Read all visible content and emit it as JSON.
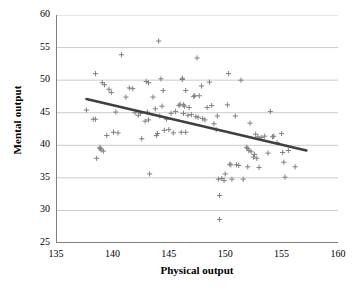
{
  "chart_data": {
    "type": "scatter",
    "title": "",
    "xlabel": "Physical output",
    "ylabel": "Mental output",
    "xlim": [
      135,
      160
    ],
    "ylim": [
      25,
      60
    ],
    "xticks": [
      135,
      140,
      145,
      150,
      155,
      160
    ],
    "yticks": [
      25,
      30,
      35,
      40,
      45,
      50,
      55,
      60
    ],
    "grid": "horizontal",
    "legend": "none",
    "marker": "plus",
    "marker_color": "#808080",
    "trendline_color": "#404040",
    "trendline": {
      "x": [
        137.7,
        157.2
      ],
      "y": [
        47.1,
        39.2
      ]
    },
    "points": [
      [
        137.7,
        45.4
      ],
      [
        138.3,
        44.0
      ],
      [
        138.5,
        44.0
      ],
      [
        138.5,
        51.0
      ],
      [
        138.6,
        38.0
      ],
      [
        138.9,
        39.7
      ],
      [
        138.9,
        39.5
      ],
      [
        139.0,
        39.3
      ],
      [
        139.1,
        49.6
      ],
      [
        139.2,
        39.1
      ],
      [
        139.3,
        49.3
      ],
      [
        139.5,
        41.5
      ],
      [
        139.7,
        48.6
      ],
      [
        139.9,
        48.1
      ],
      [
        140.1,
        42.0
      ],
      [
        140.3,
        45.1
      ],
      [
        140.5,
        41.9
      ],
      [
        140.8,
        53.9
      ],
      [
        141.2,
        47.4
      ],
      [
        141.5,
        48.8
      ],
      [
        141.8,
        48.7
      ],
      [
        142.0,
        45.0
      ],
      [
        142.3,
        44.6
      ],
      [
        142.5,
        44.9
      ],
      [
        142.6,
        41.0
      ],
      [
        142.9,
        43.7
      ],
      [
        143.0,
        49.8
      ],
      [
        143.1,
        45.1
      ],
      [
        143.2,
        49.6
      ],
      [
        143.2,
        43.9
      ],
      [
        143.3,
        35.6
      ],
      [
        143.6,
        47.4
      ],
      [
        143.8,
        45.6
      ],
      [
        143.9,
        41.5
      ],
      [
        144.0,
        41.8
      ],
      [
        144.1,
        56.0
      ],
      [
        144.2,
        44.5
      ],
      [
        144.3,
        50.2
      ],
      [
        144.4,
        46.0
      ],
      [
        144.5,
        48.4
      ],
      [
        144.6,
        42.3
      ],
      [
        144.8,
        44.0
      ],
      [
        145.0,
        42.4
      ],
      [
        145.2,
        44.9
      ],
      [
        145.4,
        41.9
      ],
      [
        145.6,
        45.2
      ],
      [
        145.9,
        46.1
      ],
      [
        146.0,
        46.3
      ],
      [
        146.1,
        42.0
      ],
      [
        146.2,
        50.3
      ],
      [
        146.2,
        50.1
      ],
      [
        146.3,
        46.2
      ],
      [
        146.3,
        44.9
      ],
      [
        146.4,
        46.0
      ],
      [
        146.5,
        48.4
      ],
      [
        146.5,
        42.0
      ],
      [
        146.7,
        44.6
      ],
      [
        146.8,
        45.8
      ],
      [
        147.0,
        44.7
      ],
      [
        147.2,
        47.5
      ],
      [
        147.3,
        47.6
      ],
      [
        147.4,
        44.4
      ],
      [
        147.5,
        53.4
      ],
      [
        147.6,
        44.3
      ],
      [
        147.7,
        47.6
      ],
      [
        147.9,
        49.1
      ],
      [
        148.0,
        44.1
      ],
      [
        148.2,
        43.9
      ],
      [
        148.4,
        45.8
      ],
      [
        148.6,
        49.7
      ],
      [
        148.8,
        46.1
      ],
      [
        149.0,
        43.3
      ],
      [
        149.2,
        42.4
      ],
      [
        149.3,
        44.5
      ],
      [
        149.4,
        34.8
      ],
      [
        149.5,
        32.3
      ],
      [
        149.5,
        28.6
      ],
      [
        149.7,
        34.9
      ],
      [
        149.9,
        34.6
      ],
      [
        150.0,
        35.6
      ],
      [
        150.2,
        46.2
      ],
      [
        150.3,
        51.0
      ],
      [
        150.4,
        37.1
      ],
      [
        150.5,
        37.0
      ],
      [
        150.6,
        34.8
      ],
      [
        150.9,
        44.5
      ],
      [
        151.0,
        37.0
      ],
      [
        151.2,
        36.9
      ],
      [
        151.4,
        50.0
      ],
      [
        151.6,
        34.8
      ],
      [
        151.9,
        39.7
      ],
      [
        152.0,
        39.5
      ],
      [
        152.0,
        36.7
      ],
      [
        152.1,
        39.2
      ],
      [
        152.2,
        43.4
      ],
      [
        152.3,
        39.0
      ],
      [
        152.5,
        38.2
      ],
      [
        152.6,
        38.6
      ],
      [
        152.7,
        41.7
      ],
      [
        152.8,
        38.0
      ],
      [
        152.9,
        41.3
      ],
      [
        153.0,
        36.6
      ],
      [
        153.2,
        41.2
      ],
      [
        153.5,
        41.4
      ],
      [
        153.8,
        38.8
      ],
      [
        154.0,
        45.2
      ],
      [
        154.2,
        41.3
      ],
      [
        154.3,
        41.4
      ],
      [
        154.6,
        40.4
      ],
      [
        155.0,
        41.8
      ],
      [
        155.1,
        38.9
      ],
      [
        155.2,
        37.4
      ],
      [
        155.3,
        35.1
      ],
      [
        155.6,
        39.2
      ],
      [
        156.2,
        36.7
      ]
    ]
  }
}
